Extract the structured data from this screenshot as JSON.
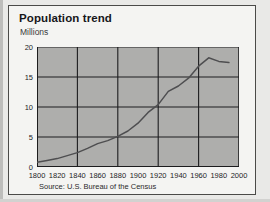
{
  "card": {
    "title": "Population trend",
    "subtitle": "Millions",
    "source": "Source: U.S. Bureau of the Census"
  },
  "chart_data": {
    "type": "line",
    "title": "Population trend",
    "xlabel": "",
    "ylabel": "Millions",
    "xlim": [
      1800,
      2000
    ],
    "ylim": [
      0,
      20
    ],
    "xticks": [
      1800,
      1820,
      1840,
      1860,
      1880,
      1900,
      1920,
      1940,
      1960,
      1980,
      2000
    ],
    "yticks": [
      0,
      5,
      10,
      15,
      20
    ],
    "xtick_labels": [
      "1800",
      "1820",
      "1840",
      "1860",
      "1880",
      "1900",
      "1920",
      "1940",
      "1960",
      "1980",
      "2000"
    ],
    "ytick_labels": [
      "0",
      "5",
      "10",
      "15",
      "20"
    ],
    "grid": {
      "vertical_every": 40,
      "horizontal_every": 5,
      "vertical_at": [
        1800,
        1840,
        1880,
        1920,
        1960,
        2000
      ],
      "horizontal_at": [
        0,
        5,
        10,
        15,
        20
      ],
      "color": "#1d1d1f"
    },
    "legend": null,
    "plot_background": "#aeaeac",
    "line_color": "#4e4e50",
    "series": [
      {
        "name": "Population",
        "x": [
          1800,
          1810,
          1820,
          1830,
          1840,
          1850,
          1860,
          1870,
          1880,
          1890,
          1900,
          1910,
          1920,
          1930,
          1940,
          1950,
          1960,
          1970,
          1980,
          1990
        ],
        "values": [
          0.8,
          1.1,
          1.4,
          1.9,
          2.4,
          3.1,
          3.9,
          4.4,
          5.1,
          6.0,
          7.3,
          9.1,
          10.4,
          12.6,
          13.5,
          14.8,
          16.8,
          18.2,
          17.6,
          17.4
        ]
      }
    ]
  }
}
